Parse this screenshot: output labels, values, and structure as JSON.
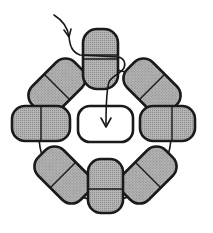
{
  "diagram": {
    "type": "circular-arrangement",
    "colors": {
      "background": "#ffffff",
      "shaded_fill": "#a9a9a9",
      "outline": "#1a1a1a",
      "center_fill": "#ffffff"
    },
    "circle": {
      "cx": 105,
      "cy": 135,
      "r": 66
    },
    "outer_elements": [
      {
        "id": "top",
        "angle": 0
      },
      {
        "id": "top-right",
        "angle": 45
      },
      {
        "id": "right",
        "angle": 90
      },
      {
        "id": "bottom-right",
        "angle": 135
      },
      {
        "id": "bottom",
        "angle": 180
      },
      {
        "id": "bottom-left",
        "angle": 225
      },
      {
        "id": "left",
        "angle": 270
      },
      {
        "id": "top-left",
        "angle": 315
      }
    ],
    "center_element": {
      "id": "center",
      "fill": "empty"
    },
    "arrow": {
      "from": "outside-top-left",
      "via": "top",
      "to": "center"
    }
  }
}
